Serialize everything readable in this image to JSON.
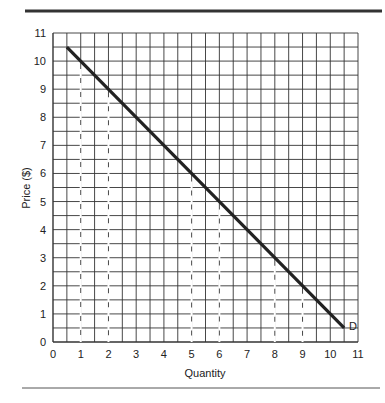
{
  "chart_data": {
    "type": "line",
    "title": "",
    "xlabel": "Quantity",
    "ylabel": "Price ($)",
    "xlim": [
      0,
      11
    ],
    "ylim": [
      0,
      11
    ],
    "x_ticks": [
      "0",
      "1",
      "2",
      "3",
      "4",
      "5",
      "6",
      "7",
      "8",
      "9",
      "10",
      "11"
    ],
    "y_ticks": [
      "0",
      "1",
      "2",
      "3",
      "4",
      "5",
      "6",
      "7",
      "8",
      "9",
      "10",
      "11"
    ],
    "grid": {
      "on": true,
      "minor_step": 0.5
    },
    "series": [
      {
        "name": "D",
        "label": "D",
        "points": [
          [
            0.5,
            10.5
          ],
          [
            10.5,
            0.5
          ]
        ],
        "color": "#222222"
      }
    ],
    "dashed_guides_x": [
      1,
      2,
      5,
      6,
      8,
      9
    ],
    "annotations": [
      {
        "text": "D",
        "x": 10.6,
        "y": 0.5
      }
    ]
  },
  "colors": {
    "line": "#222222",
    "grid": "#333333",
    "rule": "#444444"
  }
}
